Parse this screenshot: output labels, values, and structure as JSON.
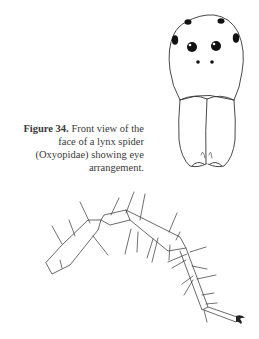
{
  "figure": {
    "label": "Figure 34.",
    "caption": " Front view of the face of a lynx spider (Oxyopidae) showing eye arrangement."
  },
  "illustrations": [
    {
      "name": "spider-face-front-view",
      "icon": "spider-face-drawing"
    },
    {
      "name": "spider-leg",
      "icon": "spider-leg-drawing"
    }
  ]
}
